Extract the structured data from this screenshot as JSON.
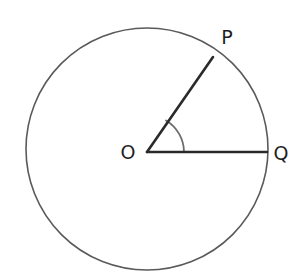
{
  "figure": {
    "name": "circle-with-central-angle",
    "canvas": {
      "width": 302,
      "height": 280,
      "background": "#ffffff"
    },
    "circle": {
      "name": "circle-outline",
      "center_x": 147,
      "center_y": 149,
      "radius": 121,
      "stroke_color": "#5a5a5a",
      "stroke_width": 1.6,
      "fill": "none"
    },
    "center_point": {
      "label": "O",
      "x": 147,
      "y": 152
    },
    "radii": [
      {
        "name": "radius-op",
        "label": "OP",
        "from_x": 147,
        "from_y": 152,
        "to_x": 213,
        "to_y": 57,
        "stroke_color": "#2a2a2a",
        "stroke_width": 2.6,
        "angle_degrees": 55
      },
      {
        "name": "radius-oq",
        "label": "OQ",
        "from_x": 147,
        "from_y": 152,
        "to_x": 267,
        "to_y": 152,
        "stroke_color": "#2a2a2a",
        "stroke_width": 2.6,
        "angle_degrees": 0
      }
    ],
    "angle_arc": {
      "name": "angle-poq-arc",
      "path": "M 166.0 120.4 A 37 37 0 0 1 184 152",
      "stroke_color": "#6d6d6d",
      "stroke_width": 1.8,
      "radius": 37
    },
    "labels": [
      {
        "text": "O",
        "x": 128,
        "y": 153,
        "name": "point-label-o"
      },
      {
        "text": "P",
        "x": 227,
        "y": 38,
        "name": "point-label-p"
      },
      {
        "text": "Q",
        "x": 281,
        "y": 154,
        "name": "point-label-q"
      }
    ]
  }
}
